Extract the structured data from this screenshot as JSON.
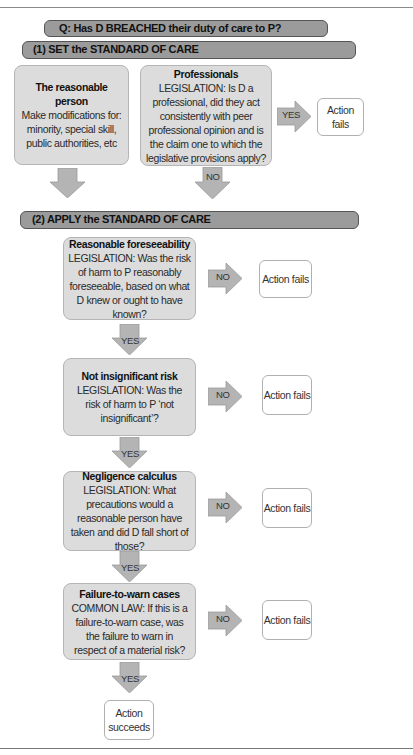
{
  "question": "Q: Has D BREACHED their duty of care to P?",
  "section1": {
    "title": "(1) SET the STANDARD OF CARE",
    "reasonable_person": {
      "title": "The reasonable person",
      "text": "Make modifications for: minority, special skill, public authorities, etc"
    },
    "professionals": {
      "title": "Professionals",
      "text": "LEGISLATION: Is D a professional, did they act consistently with peer professional opinion and is the claim one to which the legislative provisions apply?"
    },
    "yes_label": "YES",
    "no_label": "NO",
    "outcome": "Action fails"
  },
  "section2": {
    "title": "(2) APPLY the STANDARD OF CARE",
    "steps": [
      {
        "title": "Reasonable foreseeability",
        "text": "LEGISLATION: Was the risk of harm to P reasonably foreseeable, based on what D knew or ought to have known?",
        "no_label": "NO",
        "outcome": "Action fails",
        "yes_label": "YES"
      },
      {
        "title": "Not insignificant risk",
        "text": "LEGISLATION: Was the risk of harm to P ‘not insignificant’?",
        "no_label": "NO",
        "outcome": "Action fails",
        "yes_label": "YES"
      },
      {
        "title": "Negligence calculus",
        "text": "LEGISLATION: What precautions would a reasonable person have taken and did D fall short of those?",
        "no_label": "NO",
        "outcome": "Action fails",
        "yes_label": "YES"
      },
      {
        "title": "Failure-to-warn cases",
        "text": "COMMON LAW: If this is a failure-to-warn case, was the failure to warn in respect of a material risk?",
        "no_label": "NO",
        "outcome": "Action fails",
        "yes_label": "YES"
      }
    ],
    "final_outcome": "Action succeeds"
  },
  "colors": {
    "bar_fill": "#9b9b9b",
    "box_fill": "#dcdcdc",
    "arrow_fill": "#b4b4b4",
    "outcome_fill": "#ffffff"
  }
}
